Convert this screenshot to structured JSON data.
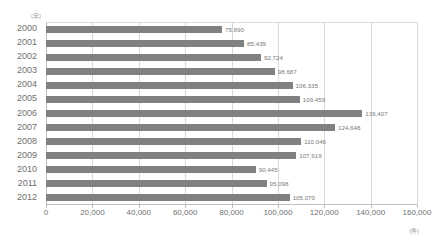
{
  "chart_data": {
    "type": "bar",
    "orientation": "horizontal",
    "title": "",
    "xlabel": "",
    "ylabel": "",
    "y_unit_label": "(年)",
    "x_unit_label": "(件)",
    "categories": [
      "2000",
      "2001",
      "2002",
      "2003",
      "2004",
      "2005",
      "2006",
      "2007",
      "2008",
      "2009",
      "2010",
      "2011",
      "2012"
    ],
    "values": [
      75890,
      85439,
      92724,
      98687,
      106335,
      109459,
      136407,
      124648,
      110046,
      107919,
      90445,
      95098,
      105070
    ],
    "value_labels": [
      "75,890",
      "85,439",
      "92,724",
      "98,687",
      "106,335",
      "109,459",
      "136,407",
      "124,648",
      "110,046",
      "107,919",
      "90,445",
      "95,098",
      "105,070"
    ],
    "xlim": [
      0,
      160000
    ],
    "xticks": [
      0,
      20000,
      40000,
      60000,
      80000,
      100000,
      120000,
      140000,
      160000
    ],
    "xtick_labels": [
      "0",
      "20,000",
      "40,000",
      "60,000",
      "80,000",
      "100,000",
      "120,000",
      "140,000",
      "160,000"
    ],
    "grid": true,
    "legend": false,
    "bar_color": "#808080",
    "gridline_color": "#d9d9d9",
    "label_color": "#6f6f6f"
  }
}
